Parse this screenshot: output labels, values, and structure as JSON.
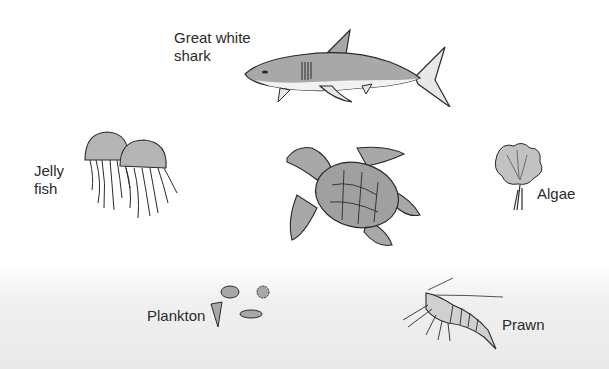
{
  "diagram": {
    "type": "marine-food-web-organisms",
    "organisms": [
      {
        "id": "shark",
        "label": "Great white\nshark"
      },
      {
        "id": "jellyfish",
        "label": "Jelly\nfish"
      },
      {
        "id": "turtle",
        "label": ""
      },
      {
        "id": "algae",
        "label": "Algae"
      },
      {
        "id": "plankton",
        "label": "Plankton"
      },
      {
        "id": "prawn",
        "label": "Prawn"
      }
    ]
  },
  "colors": {
    "outline": "#2a2a2a",
    "body_fill": "#a8a8a8",
    "light_fill": "#e8e8e8",
    "background_bottom": "#e9e9e9"
  }
}
